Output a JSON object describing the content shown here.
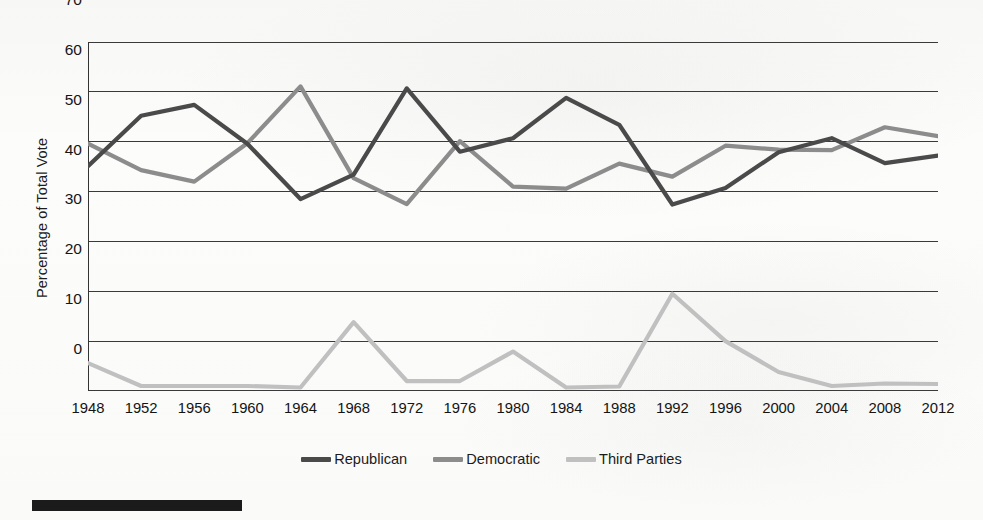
{
  "chart_data": {
    "type": "line",
    "title": "",
    "xlabel": "",
    "ylabel": "Percentage of Total Vote",
    "categories": [
      1948,
      1952,
      1956,
      1960,
      1964,
      1968,
      1972,
      1976,
      1980,
      1984,
      1988,
      1992,
      1996,
      2000,
      2004,
      2008,
      2012
    ],
    "x_tick_labels": [
      "1948",
      "1952",
      "1956",
      "1960",
      "1964",
      "1968",
      "1972",
      "1976",
      "1980",
      "1984",
      "1988",
      "1992",
      "1996",
      "2000",
      "2004",
      "2008",
      "2012"
    ],
    "y_tick_labels": [
      "0",
      "10",
      "20",
      "30",
      "40",
      "50",
      "60",
      "70"
    ],
    "y_ticks": [
      0,
      10,
      20,
      30,
      40,
      50,
      60,
      70
    ],
    "ylim": [
      0,
      70
    ],
    "grid": "horizontal",
    "legend_position": "bottom-center",
    "series": [
      {
        "name": "Republican",
        "color": "#4a4a4a",
        "values": [
          45.1,
          55.2,
          57.4,
          49.6,
          38.5,
          43.4,
          60.7,
          48.0,
          50.7,
          58.8,
          53.4,
          37.4,
          40.7,
          47.9,
          50.7,
          45.7,
          47.2
        ]
      },
      {
        "name": "Democratic",
        "color": "#8c8c8c",
        "values": [
          49.6,
          44.3,
          42.0,
          49.7,
          61.1,
          42.7,
          37.5,
          50.1,
          41.0,
          40.6,
          45.6,
          43.0,
          49.2,
          48.4,
          48.3,
          52.9,
          51.1
        ]
      },
      {
        "name": "Third Parties",
        "color": "#c0c0c0",
        "values": [
          5.6,
          1.0,
          1.0,
          1.0,
          0.7,
          13.8,
          2.0,
          2.0,
          7.9,
          0.7,
          0.9,
          19.5,
          10.0,
          3.8,
          1.0,
          1.5,
          1.4
        ]
      }
    ]
  },
  "legend": {
    "items": [
      {
        "label": "Republican",
        "color": "#4a4a4a"
      },
      {
        "label": "Democratic",
        "color": "#8c8c8c"
      },
      {
        "label": "Third Parties",
        "color": "#c0c0c0"
      }
    ]
  },
  "axis": {
    "y_title": "Percentage of Total Vote"
  },
  "style": {
    "axis_line_color": "#333333",
    "grid_line_color": "#3a3a3a",
    "page_background": "#fbfbfa",
    "footer_rule_color": "#1b1b1b"
  }
}
